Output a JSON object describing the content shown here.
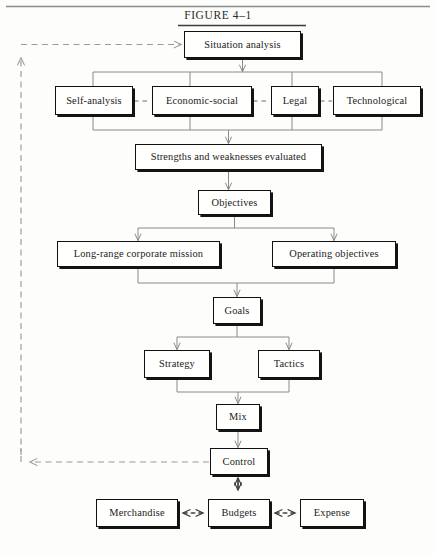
{
  "figure": {
    "title": "FIGURE  4–1",
    "top_rule": true,
    "colors": {
      "box_border": "#111111",
      "box_fill": "#fffffe",
      "connector": "#8a8a88",
      "feedback_dashed": "#9a9a98",
      "text": "#1b1b1b",
      "page_background": "#fdfdfc"
    }
  },
  "nodes": {
    "situation_analysis": {
      "label": "Situation analysis",
      "x": 184,
      "y": 31,
      "w": 117,
      "h": 27
    },
    "self_analysis": {
      "label": "Self-analysis",
      "x": 55,
      "y": 86,
      "w": 78,
      "h": 29
    },
    "economic_social": {
      "label": "Economic-social",
      "x": 152,
      "y": 86,
      "w": 100,
      "h": 29
    },
    "legal": {
      "label": "Legal",
      "x": 271,
      "y": 86,
      "w": 48,
      "h": 29
    },
    "technological": {
      "label": "Technological",
      "x": 333,
      "y": 86,
      "w": 88,
      "h": 29
    },
    "strengths": {
      "label": "Strengths and weaknesses evaluated",
      "x": 135,
      "y": 144,
      "w": 187,
      "h": 26
    },
    "objectives": {
      "label": "Objectives",
      "x": 198,
      "y": 190,
      "w": 73,
      "h": 25
    },
    "long_range_mission": {
      "label": "Long-range corporate mission",
      "x": 57,
      "y": 241,
      "w": 163,
      "h": 26
    },
    "operating_objectives": {
      "label": "Operating objectives",
      "x": 272,
      "y": 241,
      "w": 124,
      "h": 26
    },
    "goals": {
      "label": "Goals",
      "x": 213,
      "y": 297,
      "w": 48,
      "h": 27
    },
    "strategy": {
      "label": "Strategy",
      "x": 144,
      "y": 350,
      "w": 66,
      "h": 28
    },
    "tactics": {
      "label": "Tactics",
      "x": 258,
      "y": 350,
      "w": 62,
      "h": 28
    },
    "mix": {
      "label": "Mix",
      "x": 216,
      "y": 404,
      "w": 44,
      "h": 26
    },
    "control": {
      "label": "Control",
      "x": 210,
      "y": 448,
      "w": 58,
      "h": 27
    },
    "merchandise": {
      "label": "Merchandise",
      "x": 96,
      "y": 499,
      "w": 82,
      "h": 28
    },
    "budgets": {
      "label": "Budgets",
      "x": 208,
      "y": 499,
      "w": 62,
      "h": 28
    },
    "expense": {
      "label": "Expense",
      "x": 300,
      "y": 499,
      "w": 64,
      "h": 28
    }
  },
  "edges": [
    {
      "name": "situation-to-environment-bracket",
      "from": "situation_analysis",
      "to": "environment-row",
      "style": "solid-arrow"
    },
    {
      "name": "environment-bracket-to-strengths",
      "from": "environment-row",
      "to": "strengths",
      "style": "solid-arrow"
    },
    {
      "name": "strengths-to-objectives",
      "from": "strengths",
      "to": "objectives",
      "style": "solid-arrow"
    },
    {
      "name": "objectives-to-long-range-mission",
      "from": "objectives",
      "to": "long_range_mission",
      "style": "solid-arrow"
    },
    {
      "name": "objectives-to-operating-objectives",
      "from": "objectives",
      "to": "operating_objectives",
      "style": "solid-arrow"
    },
    {
      "name": "mission-objectives-to-goals",
      "from": "long_range_mission",
      "to": "goals",
      "style": "solid-arrow"
    },
    {
      "name": "goals-to-strategy",
      "from": "goals",
      "to": "strategy",
      "style": "solid-arrow"
    },
    {
      "name": "goals-to-tactics",
      "from": "goals",
      "to": "tactics",
      "style": "solid-arrow"
    },
    {
      "name": "strategy-tactics-to-mix",
      "from": "strategy",
      "to": "mix",
      "style": "solid-arrow"
    },
    {
      "name": "mix-to-control",
      "from": "mix",
      "to": "control",
      "style": "solid-arrow"
    },
    {
      "name": "control-to-situation-feedback",
      "from": "control",
      "to": "situation_analysis",
      "style": "dashed-arrow"
    },
    {
      "name": "control-budgets-two-way",
      "from": "control",
      "to": "budgets",
      "style": "double-arrow-vertical"
    },
    {
      "name": "merchandise-budgets-two-way",
      "from": "merchandise",
      "to": "budgets",
      "style": "dashed-double-arrow"
    },
    {
      "name": "budgets-expense-two-way",
      "from": "budgets",
      "to": "expense",
      "style": "dashed-double-arrow"
    },
    {
      "name": "self-analysis-economic-link",
      "from": "self_analysis",
      "to": "economic_social",
      "style": "dashed"
    },
    {
      "name": "economic-legal-link",
      "from": "economic_social",
      "to": "legal",
      "style": "dashed"
    },
    {
      "name": "legal-technological-link",
      "from": "legal",
      "to": "technological",
      "style": "dashed"
    }
  ]
}
